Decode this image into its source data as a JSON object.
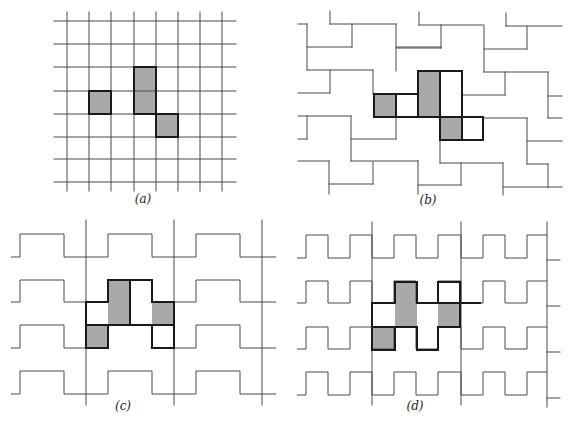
{
  "figure": {
    "colors": {
      "line": "#4a4a4a",
      "bold": "#1a1a1a",
      "shade": "#a9a9a9",
      "background": "#ffffff"
    },
    "panels": [
      {
        "id": "a",
        "label": "(a)",
        "label_pos": [
          143,
          201
        ],
        "description": "Square lattice with three shaded cells (one 1x1, one 1x2, one 1x1)",
        "lines": [
          [
            67,
            12,
            67,
            191
          ],
          [
            89,
            12,
            89,
            191
          ],
          [
            111,
            12,
            111,
            191
          ],
          [
            134,
            12,
            134,
            191
          ],
          [
            156,
            12,
            156,
            191
          ],
          [
            178,
            12,
            178,
            191
          ],
          [
            200,
            12,
            200,
            191
          ],
          [
            222,
            12,
            222,
            191
          ],
          [
            54,
            21,
            236,
            21
          ],
          [
            54,
            44,
            236,
            44
          ],
          [
            54,
            67,
            236,
            67
          ],
          [
            54,
            91,
            236,
            91
          ],
          [
            54,
            114,
            236,
            114
          ],
          [
            54,
            137,
            236,
            137
          ],
          [
            54,
            159,
            236,
            159
          ],
          [
            54,
            182,
            236,
            182
          ]
        ],
        "shaded": [
          [
            89,
            91,
            22,
            23
          ],
          [
            134,
            67,
            22,
            47
          ],
          [
            156,
            114,
            22,
            23
          ]
        ],
        "bold_rects": [
          [
            89,
            91,
            22,
            23
          ],
          [
            134,
            67,
            22,
            47
          ],
          [
            156,
            114,
            22,
            23
          ]
        ]
      },
      {
        "id": "b",
        "label": "(b)",
        "label_pos": [
          428,
          202
        ],
        "description": "Staggered zig-zag tiling with shaded cells and bold outlined tile",
        "lines": [
          [
            298,
            24,
            307,
            24
          ],
          [
            307,
            24,
            307,
            70
          ],
          [
            330,
            11,
            330,
            24
          ],
          [
            330,
            24,
            396,
            24
          ],
          [
            352,
            24,
            352,
            47
          ],
          [
            307,
            47,
            352,
            47
          ],
          [
            307,
            70,
            373,
            70
          ],
          [
            330,
            70,
            330,
            93
          ],
          [
            298,
            93,
            330,
            93
          ],
          [
            396,
            24,
            396,
            71
          ],
          [
            396,
            47,
            441,
            47
          ],
          [
            419,
            12,
            419,
            25
          ],
          [
            419,
            25,
            484,
            25
          ],
          [
            441,
            25,
            441,
            48
          ],
          [
            397,
            48,
            441,
            48
          ],
          [
            484,
            26,
            484,
            72
          ],
          [
            484,
            49,
            527,
            49
          ],
          [
            527,
            26,
            527,
            49
          ],
          [
            506,
            13,
            506,
            26
          ],
          [
            506,
            26,
            562,
            26
          ],
          [
            484,
            72,
            548,
            72
          ],
          [
            505,
            72,
            505,
            95
          ],
          [
            462,
            95,
            505,
            95
          ],
          [
            548,
            72,
            548,
            118
          ],
          [
            548,
            96,
            562,
            96
          ],
          [
            548,
            118,
            562,
            118
          ],
          [
            373,
            70,
            373,
            94
          ],
          [
            298,
            116,
            351,
            116
          ],
          [
            307,
            116,
            307,
            139
          ],
          [
            298,
            139,
            307,
            139
          ],
          [
            351,
            116,
            351,
            161
          ],
          [
            351,
            139,
            396,
            139
          ],
          [
            396,
            116,
            396,
            139
          ],
          [
            298,
            161,
            329,
            161
          ],
          [
            329,
            161,
            329,
            194
          ],
          [
            329,
            184,
            373,
            184
          ],
          [
            373,
            162,
            373,
            184
          ],
          [
            351,
            161,
            418,
            161
          ],
          [
            418,
            161,
            418,
            194
          ],
          [
            418,
            185,
            461,
            185
          ],
          [
            461,
            163,
            461,
            185
          ],
          [
            440,
            139,
            440,
            163
          ],
          [
            440,
            163,
            503,
            163
          ],
          [
            503,
            163,
            503,
            195
          ],
          [
            483,
            118,
            527,
            118
          ],
          [
            527,
            118,
            527,
            164
          ],
          [
            527,
            141,
            562,
            141
          ],
          [
            527,
            164,
            548,
            164
          ],
          [
            548,
            164,
            548,
            187
          ],
          [
            503,
            187,
            548,
            187
          ],
          [
            548,
            187,
            562,
            187
          ]
        ],
        "shaded": [
          [
            374,
            94,
            22,
            23
          ],
          [
            418,
            71,
            22,
            46
          ],
          [
            440,
            117,
            22,
            22
          ]
        ],
        "bold_polys": [
          [
            [
              374,
              94
            ],
            [
              418,
              94
            ],
            [
              418,
              71
            ],
            [
              462,
              71
            ],
            [
              462,
              117
            ],
            [
              483,
              117
            ],
            [
              483,
              140
            ],
            [
              440,
              140
            ],
            [
              440,
              117
            ],
            [
              374,
              117
            ]
          ]
        ],
        "bold_lines": [
          [
            396,
            94,
            396,
            117
          ],
          [
            418,
            94,
            418,
            117
          ],
          [
            440,
            71,
            440,
            117
          ],
          [
            440,
            117,
            462,
            117
          ],
          [
            462,
            117,
            462,
            140
          ]
        ]
      },
      {
        "id": "c",
        "label": "(c)",
        "label_pos": [
          123,
          408
        ],
        "description": "Square-wave rows (period 88px) crossed by vertical lines; shaded cells with bold outlined tile",
        "verticals": [
          [
            86,
            220,
            405
          ],
          [
            174,
            220,
            405
          ],
          [
            262,
            220,
            405
          ]
        ],
        "wave": {
          "x_points": [
            11,
            20,
            64,
            108,
            152,
            196,
            240,
            276
          ],
          "start_low": true
        },
        "rows": [
          [
            234,
            257
          ],
          [
            280,
            302
          ],
          [
            325,
            348
          ],
          [
            371,
            394
          ]
        ],
        "shaded": [
          [
            86,
            325,
            22,
            23
          ],
          [
            108,
            280,
            22,
            45
          ],
          [
            152,
            302,
            22,
            23
          ]
        ],
        "bold_polys": [
          [
            [
              86,
              302
            ],
            [
              108,
              302
            ],
            [
              108,
              280
            ],
            [
              152,
              280
            ],
            [
              152,
              302
            ],
            [
              174,
              302
            ],
            [
              174,
              348
            ],
            [
              152,
              348
            ],
            [
              152,
              325
            ],
            [
              108,
              325
            ],
            [
              108,
              348
            ],
            [
              86,
              348
            ]
          ]
        ],
        "bold_lines": [
          [
            86,
            325,
            108,
            325
          ],
          [
            130,
            280,
            130,
            325
          ],
          [
            108,
            325,
            152,
            325
          ],
          [
            152,
            325,
            174,
            325
          ]
        ]
      },
      {
        "id": "d",
        "label": "(d)",
        "label_pos": [
          415,
          408
        ],
        "description": "Square-wave rows (period 44px) crossed by vertical lines; shaded cells with bold outlined tile",
        "verticals": [
          [
            372,
            222,
            405
          ],
          [
            461,
            222,
            405
          ],
          [
            547,
            222,
            407
          ]
        ],
        "wave": {
          "x_points": [
            297,
            306,
            328,
            350,
            372,
            394,
            416,
            438,
            461,
            483,
            505,
            527,
            547
          ],
          "start_low": true
        },
        "rows": [
          [
            235,
            258
          ],
          [
            281,
            303
          ],
          [
            327,
            349
          ],
          [
            372,
            395
          ]
        ],
        "stubs": [
          [
            547,
            260,
            560,
            260
          ],
          [
            547,
            306,
            560,
            306
          ],
          [
            547,
            352,
            560,
            352
          ],
          [
            547,
            398,
            560,
            398
          ]
        ],
        "shaded": [
          [
            372,
            327,
            23,
            23
          ],
          [
            395,
            282,
            22,
            45
          ],
          [
            438,
            303,
            22,
            24
          ]
        ],
        "bold_polys": [
          [
            [
              372,
              303
            ],
            [
              395,
              303
            ],
            [
              395,
              282
            ],
            [
              417,
              282
            ],
            [
              417,
              303
            ],
            [
              438,
              303
            ],
            [
              438,
              282
            ],
            [
              460,
              282
            ],
            [
              460,
              327
            ],
            [
              438,
              327
            ],
            [
              438,
              350
            ],
            [
              417,
              350
            ],
            [
              417,
              327
            ],
            [
              395,
              327
            ],
            [
              395,
              350
            ],
            [
              372,
              350
            ]
          ]
        ],
        "bold_lines": [
          [
            372,
            327,
            417,
            327
          ],
          [
            417,
            303,
            480,
            303
          ],
          [
            438,
            303,
            460,
            303
          ]
        ]
      }
    ]
  }
}
